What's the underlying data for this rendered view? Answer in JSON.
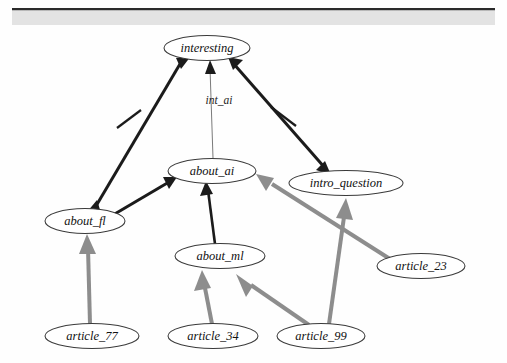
{
  "page": {
    "background_color": "#ffffff",
    "header_band_color": "#e3e3e3",
    "header_rule_color": "#2a2a2a"
  },
  "colors": {
    "node_stroke": "#3a3a3a",
    "node_fill": "#ffffff",
    "support_edge": "#8d8d8d",
    "attack_edge": "#1b1b1b",
    "label_edge": "#7a7a7a",
    "text": "#111111"
  },
  "graph": {
    "type": "directed-graph",
    "nodes": [
      {
        "id": "interesting",
        "label": "interesting",
        "cx": 207,
        "cy": 48,
        "rx": 43,
        "ry": 12.5
      },
      {
        "id": "about_ai",
        "label": "about_ai",
        "cx": 212,
        "cy": 171,
        "rx": 44,
        "ry": 12.5
      },
      {
        "id": "intro_question",
        "label": "intro_question",
        "cx": 346,
        "cy": 183,
        "rx": 57,
        "ry": 12.5
      },
      {
        "id": "about_fl",
        "label": "about_fl",
        "cx": 85,
        "cy": 221,
        "rx": 40,
        "ry": 12.5
      },
      {
        "id": "about_ml",
        "label": "about_ml",
        "cx": 220,
        "cy": 256,
        "rx": 45,
        "ry": 12.5
      },
      {
        "id": "article_77",
        "label": "article_77",
        "cx": 92,
        "cy": 336,
        "rx": 47,
        "ry": 12.5
      },
      {
        "id": "article_34",
        "label": "article_34",
        "cx": 213,
        "cy": 336,
        "rx": 45,
        "ry": 12.5
      },
      {
        "id": "article_99",
        "label": "article_99",
        "cx": 321,
        "cy": 336,
        "rx": 44,
        "ry": 12.5
      },
      {
        "id": "article_23",
        "label": "article_23",
        "cx": 421,
        "cy": 266,
        "rx": 44,
        "ry": 12.5
      }
    ],
    "edges": [
      {
        "id": "e1",
        "from": "about_fl",
        "to": "interesting",
        "style": "attack",
        "arrow": "both",
        "tick": true,
        "label": ""
      },
      {
        "id": "e2",
        "from": "about_ai",
        "to": "interesting",
        "style": "label",
        "arrow": "forward",
        "tick": false,
        "label": "int_ai"
      },
      {
        "id": "e3",
        "from": "interesting",
        "to": "intro_question",
        "style": "attack",
        "arrow": "both",
        "tick": true,
        "label": ""
      },
      {
        "id": "e4",
        "from": "about_fl",
        "to": "about_ai",
        "style": "attack",
        "arrow": "forward",
        "tick": false,
        "label": ""
      },
      {
        "id": "e5",
        "from": "about_ml",
        "to": "about_ai",
        "style": "attack",
        "arrow": "forward",
        "tick": false,
        "label": ""
      },
      {
        "id": "e6",
        "from": "article_77",
        "to": "about_fl",
        "style": "support",
        "arrow": "forward",
        "tick": false,
        "label": ""
      },
      {
        "id": "e7",
        "from": "article_34",
        "to": "about_ml",
        "style": "support",
        "arrow": "forward",
        "tick": false,
        "label": ""
      },
      {
        "id": "e8",
        "from": "article_99",
        "to": "about_ml",
        "style": "support",
        "arrow": "forward",
        "tick": false,
        "label": ""
      },
      {
        "id": "e9",
        "from": "article_99",
        "to": "intro_question",
        "style": "support",
        "arrow": "forward",
        "tick": false,
        "label": ""
      },
      {
        "id": "e10",
        "from": "article_23",
        "to": "about_ai",
        "style": "support",
        "arrow": "forward",
        "tick": false,
        "label": ""
      }
    ],
    "edge_labels": [
      {
        "id": "int_ai",
        "text": "int_ai",
        "x": 219,
        "y": 101
      }
    ]
  }
}
